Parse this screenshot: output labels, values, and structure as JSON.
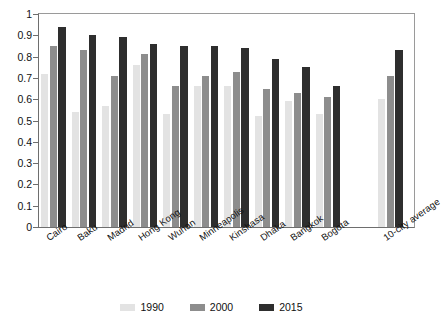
{
  "chart_data": {
    "type": "bar",
    "title": "",
    "subtitle": "",
    "xlabel": "",
    "ylabel": "",
    "ylim": [
      0,
      1
    ],
    "yticks": [
      "0",
      "0.1",
      "0.2",
      "0.3",
      "0.4",
      "0.5",
      "0.6",
      "0.7",
      "0.8",
      "0.9",
      "1"
    ],
    "grid": false,
    "legend_position": "bottom",
    "categories": [
      "Cairo",
      "Baku",
      "Madrid",
      "Hong Kong",
      "Wuhan",
      "Minneapolis",
      "Kinshasa",
      "Dhaka",
      "Bangkok",
      "Bogota",
      "10-city average"
    ],
    "series": [
      {
        "name": "1990",
        "color": "#e3e3e3",
        "values": [
          0.72,
          0.54,
          0.57,
          0.76,
          0.53,
          0.66,
          0.66,
          0.52,
          0.59,
          0.53,
          0.6
        ]
      },
      {
        "name": "2000",
        "color": "#8d8d8d",
        "values": [
          0.85,
          0.83,
          0.71,
          0.81,
          0.66,
          0.71,
          0.73,
          0.65,
          0.63,
          0.61,
          0.71
        ]
      },
      {
        "name": "2015",
        "color": "#2e2e2e",
        "values": [
          0.94,
          0.9,
          0.89,
          0.86,
          0.85,
          0.85,
          0.84,
          0.79,
          0.75,
          0.66,
          0.83
        ]
      }
    ]
  },
  "legend": {
    "items": [
      {
        "label": "1990"
      },
      {
        "label": "2000"
      },
      {
        "label": "2015"
      }
    ]
  }
}
